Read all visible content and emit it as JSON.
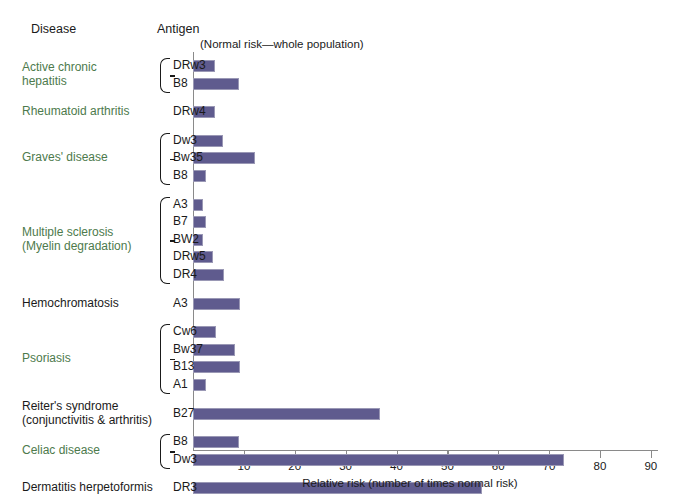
{
  "headers": {
    "disease": "Disease",
    "antigen": "Antigen",
    "note": "(Normal risk—whole population)"
  },
  "chart_data": {
    "type": "bar",
    "orientation": "horizontal",
    "title": "",
    "xlabel": "Relative risk (number of times normal risk)",
    "ylabel": "",
    "xlim": [
      0,
      92
    ],
    "xticks": [
      10,
      20,
      30,
      40,
      50,
      60,
      70,
      80,
      90
    ],
    "xtick_labels": [
      "10",
      "20",
      "30",
      "40",
      "50",
      "60",
      "70",
      "80",
      "90"
    ],
    "grid": false,
    "legend": false,
    "bar_color": "#5f5b8e",
    "annotation": "(Normal risk—whole population)",
    "groups": [
      {
        "disease": "Active chronic hepatitis",
        "disease_lines": [
          "Active chronic",
          "hepatitis"
        ],
        "color": "green",
        "antigens": [
          "DRw3",
          "B8"
        ],
        "values": [
          4.3,
          9.0
        ]
      },
      {
        "disease": "Rheumatoid arthritis",
        "disease_lines": [
          "Rheumatoid arthritis"
        ],
        "color": "green",
        "antigens": [
          "DRw4"
        ],
        "values": [
          4.3
        ]
      },
      {
        "disease": "Graves' disease",
        "disease_lines": [
          "Graves' disease"
        ],
        "color": "green",
        "antigens": [
          "Dw3",
          "Bw35",
          "B8"
        ],
        "values": [
          5.8,
          12.2,
          2.5
        ]
      },
      {
        "disease": "Multiple sclerosis (Myelin degradation)",
        "disease_lines": [
          "Multiple sclerosis",
          "(Myelin degradation)"
        ],
        "color": "green",
        "antigens": [
          "A3",
          "B7",
          "BW2",
          "DRw5",
          "DR4"
        ],
        "values": [
          2.0,
          2.5,
          2.0,
          3.9,
          6.0
        ]
      },
      {
        "disease": "Hemochromatosis",
        "disease_lines": [
          "Hemochromatosis"
        ],
        "color": "black",
        "antigens": [
          "A3"
        ],
        "values": [
          9.2
        ]
      },
      {
        "disease": "Psoriasis",
        "disease_lines": [
          "Psoriasis"
        ],
        "color": "green",
        "antigens": [
          "Cw6",
          "Bw37",
          "B13",
          "A1"
        ],
        "values": [
          4.5,
          8.3,
          9.2,
          2.5
        ]
      },
      {
        "disease": "Reiter's syndrome (conjunctivitis & arthritis)",
        "disease_lines": [
          "Reiter's syndrome",
          "(conjunctivitis & arthritis)"
        ],
        "color": "black",
        "antigens": [
          "B27"
        ],
        "values": [
          36.7
        ]
      },
      {
        "disease": "Celiac disease",
        "disease_lines": [
          "Celiac disease"
        ],
        "color": "green",
        "antigens": [
          "B8",
          "Dw3"
        ],
        "values": [
          9.1,
          72.9
        ]
      },
      {
        "disease": "Dermatitis herpetoformis",
        "disease_lines": [
          "Dermatitis herpetoformis"
        ],
        "color": "black",
        "antigens": [
          "DR3"
        ],
        "values": [
          56.8
        ]
      },
      {
        "disease": "Ankylosing spondylitis (arthritis of spine)",
        "disease_lines": [
          "Ankylosing spondylitis",
          "(arthritis of spine)"
        ],
        "color": "black",
        "antigens": [
          "B27"
        ],
        "values": [
          88.2
        ]
      }
    ]
  },
  "colors": {
    "bar": "#5f5b8e",
    "bar_border": "#9a98b5",
    "green_text": "#4d7a4c",
    "black_text": "#1a1a1a",
    "axis": "#8a8a8a"
  }
}
